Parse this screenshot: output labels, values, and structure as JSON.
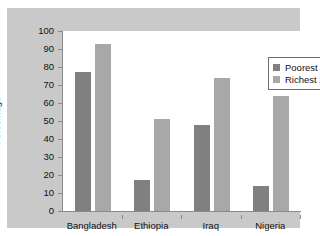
{
  "chart_data": {
    "type": "bar",
    "title": "",
    "xlabel": "",
    "ylabel": "Percentage",
    "ylim": [
      0,
      100
    ],
    "ytick_step": 10,
    "yticks": [
      100,
      90,
      80,
      70,
      60,
      50,
      40,
      30,
      20,
      10,
      0
    ],
    "grid": false,
    "legend_position": "top-right",
    "categories": [
      "Bangladesh",
      "Ethiopia",
      "Iraq",
      "Nigeria"
    ],
    "series": [
      {
        "name": "Poorest 20%",
        "color": "#808080",
        "values": [
          77,
          17,
          48,
          14
        ]
      },
      {
        "name": "Richest 20%",
        "color": "#a8a8a8",
        "values": [
          93,
          51,
          74,
          64
        ]
      }
    ]
  },
  "colors": {
    "panel_background": "#c9c9c9",
    "plot_background": "#ffffff",
    "axis_line": "#8a8a8a",
    "text": "#111111",
    "poorest": "#808080",
    "richest": "#a8a8a8"
  }
}
